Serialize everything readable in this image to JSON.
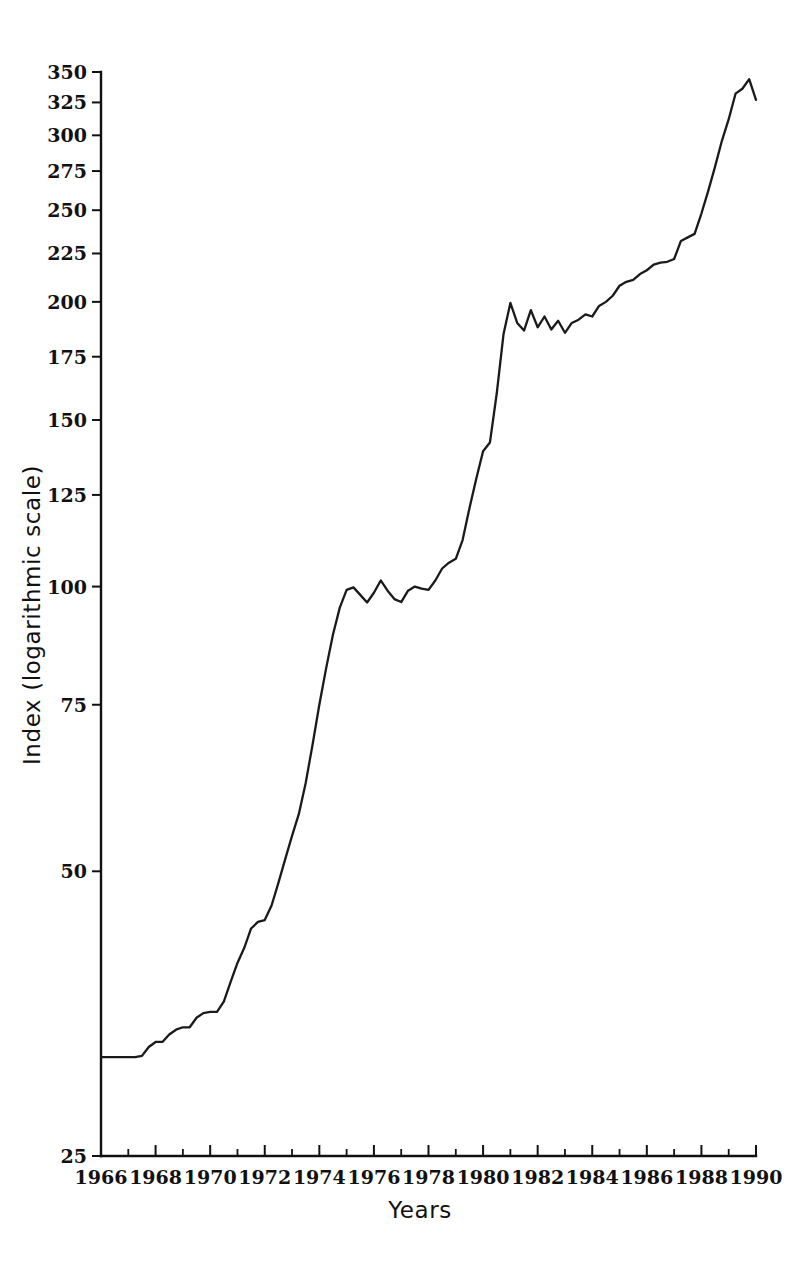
{
  "chart_data": {
    "type": "line",
    "title": "",
    "subtitle": "",
    "xlabel": "Years",
    "ylabel": "Index (logarithmic scale)",
    "yscale": "log",
    "ylim": [
      25,
      350
    ],
    "xlim": [
      1966,
      1990
    ],
    "grid": false,
    "legend": null,
    "y_ticks": [
      25,
      50,
      75,
      100,
      125,
      150,
      175,
      200,
      225,
      250,
      275,
      300,
      325,
      350
    ],
    "y_tick_labels": [
      "25",
      "50",
      "75",
      "100",
      "125",
      "150",
      "175",
      "200",
      "225",
      "250",
      "275",
      "300",
      "325",
      "350"
    ],
    "x_ticks": [
      1966,
      1967,
      1968,
      1969,
      1970,
      1971,
      1972,
      1973,
      1974,
      1975,
      1976,
      1977,
      1978,
      1979,
      1980,
      1981,
      1982,
      1983,
      1984,
      1985,
      1986,
      1987,
      1988,
      1989,
      1990
    ],
    "x_tick_labels": [
      "1966",
      "",
      "1968",
      "",
      "1970",
      "",
      "1972",
      "",
      "1974",
      "",
      "1976",
      "",
      "1978",
      "",
      "1980",
      "",
      "1982",
      "",
      "1984",
      "",
      "1986",
      "",
      "1988",
      "",
      "1990"
    ],
    "line_color": "#1a1a1a",
    "series": [
      {
        "name": "Index",
        "x": [
          1966.0,
          1966.25,
          1966.5,
          1966.75,
          1967.0,
          1967.25,
          1967.5,
          1967.75,
          1968.0,
          1968.25,
          1968.5,
          1968.75,
          1969.0,
          1969.25,
          1969.5,
          1969.75,
          1970.0,
          1970.25,
          1970.5,
          1970.75,
          1971.0,
          1971.25,
          1971.5,
          1971.75,
          1972.0,
          1972.25,
          1972.5,
          1972.75,
          1973.0,
          1973.25,
          1973.5,
          1973.75,
          1974.0,
          1974.25,
          1974.5,
          1974.75,
          1975.0,
          1975.25,
          1975.5,
          1975.75,
          1976.0,
          1976.25,
          1976.5,
          1976.75,
          1977.0,
          1977.25,
          1977.5,
          1977.75,
          1978.0,
          1978.25,
          1978.5,
          1978.75,
          1979.0,
          1979.25,
          1979.5,
          1979.75,
          1980.0,
          1980.25,
          1980.5,
          1980.75,
          1981.0,
          1981.25,
          1981.5,
          1981.75,
          1982.0,
          1982.25,
          1982.5,
          1982.75,
          1983.0,
          1983.25,
          1983.5,
          1983.75,
          1984.0,
          1984.25,
          1984.5,
          1984.75,
          1985.0,
          1985.25,
          1985.5,
          1985.75,
          1986.0,
          1986.25,
          1986.5,
          1986.75,
          1987.0,
          1987.25,
          1987.5,
          1987.75,
          1988.0,
          1988.25,
          1988.5,
          1988.75,
          1989.0,
          1989.25,
          1989.5,
          1989.75,
          1990.0
        ],
        "values": [
          31.8,
          31.8,
          31.8,
          31.8,
          31.8,
          31.8,
          31.9,
          32.6,
          33.0,
          33.0,
          33.6,
          34.0,
          34.2,
          34.2,
          35.0,
          35.4,
          35.5,
          35.5,
          36.4,
          38.2,
          40.0,
          41.5,
          43.5,
          44.2,
          44.4,
          46.0,
          48.6,
          51.5,
          54.5,
          57.5,
          62.0,
          68.0,
          75.0,
          82.0,
          89.0,
          95.0,
          99.2,
          99.8,
          98.0,
          96.2,
          98.5,
          101.5,
          99.0,
          97.0,
          96.3,
          99.0,
          100.0,
          99.5,
          99.2,
          101.5,
          104.5,
          106.0,
          107.0,
          112.0,
          121.0,
          130.0,
          139.0,
          142.0,
          160.0,
          185.0,
          199.5,
          190.0,
          186.5,
          196.0,
          188.0,
          193.0,
          187.0,
          191.0,
          185.5,
          190.0,
          191.5,
          194.0,
          193.0,
          198.0,
          200.0,
          203.0,
          208.0,
          210.0,
          211.0,
          214.0,
          216.0,
          219.0,
          220.0,
          220.5,
          222.0,
          232.0,
          234.0,
          236.0,
          248.0,
          262.0,
          278.0,
          296.0,
          312.0,
          332.0,
          336.0,
          344.0,
          327.0
        ]
      }
    ]
  },
  "axis": {
    "ylabel": "Index (logarithmic scale)",
    "xlabel": "Years"
  }
}
